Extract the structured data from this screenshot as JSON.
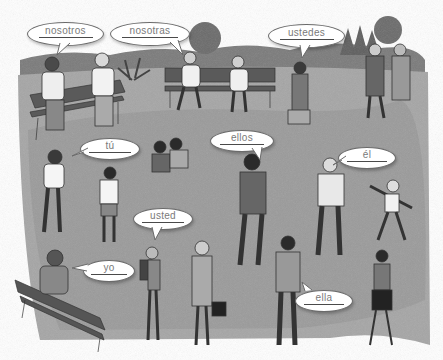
{
  "illustration": {
    "title": "Subject pronouns park scene",
    "colors": {
      "ground": "#a9a9a9",
      "path": "#9c9c9c",
      "grass": "#8f8f8f",
      "trees": "#6e6e6e",
      "sky": "#ffffff",
      "bubble_fill": "#ffffff",
      "bubble_text": "#7a7a7a"
    },
    "bubbles": [
      {
        "id": "nosotros",
        "label": "nosotros",
        "x": 27,
        "y": 22,
        "w": 75,
        "h": 22
      },
      {
        "id": "nosotras",
        "label": "nosotras",
        "x": 110,
        "y": 22,
        "w": 78,
        "h": 22
      },
      {
        "id": "ustedes",
        "label": "ustedes",
        "x": 268,
        "y": 24,
        "w": 75,
        "h": 22
      },
      {
        "id": "tu",
        "label": "tú",
        "x": 80,
        "y": 138,
        "w": 58,
        "h": 20
      },
      {
        "id": "ellos",
        "label": "ellos",
        "x": 210,
        "y": 130,
        "w": 62,
        "h": 20
      },
      {
        "id": "el",
        "label": "él",
        "x": 338,
        "y": 147,
        "w": 56,
        "h": 20
      },
      {
        "id": "usted",
        "label": "usted",
        "x": 133,
        "y": 208,
        "w": 58,
        "h": 20
      },
      {
        "id": "yo",
        "label": "yo",
        "x": 83,
        "y": 260,
        "w": 50,
        "h": 20
      },
      {
        "id": "ella",
        "label": "ella",
        "x": 295,
        "y": 290,
        "w": 56,
        "h": 20
      }
    ]
  }
}
